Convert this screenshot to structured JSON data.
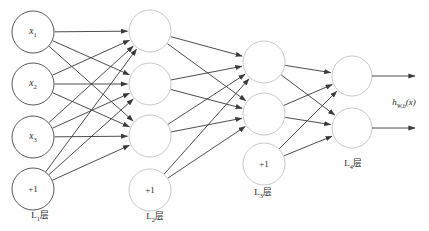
{
  "figure": {
    "type": "neural-network-diagram",
    "background_color": "#fefefe",
    "width": 429,
    "height": 231
  },
  "style": {
    "input_circle_stroke": "#5a5a64",
    "hidden_circle_stroke": "#c9c9c9",
    "edge_color": "#3a3a3a",
    "circle_fill": "#ffffff"
  },
  "layers": [
    {
      "id": "L1",
      "label_main": "L",
      "label_sub": "1",
      "label_suffix": "层",
      "label_x": 40,
      "label_y": 215,
      "cx": 33,
      "r": 21,
      "stroke": "#5a5a64",
      "nodes": [
        {
          "name": "x1",
          "text_main": "x",
          "text_sub": "1",
          "italic": true,
          "cy": 32
        },
        {
          "name": "x2",
          "text_main": "x",
          "text_sub": "2",
          "italic": true,
          "cy": 84
        },
        {
          "name": "x3",
          "text_main": "x",
          "text_sub": "3",
          "italic": true,
          "cy": 137
        },
        {
          "name": "bias-1",
          "text_main": "+1",
          "text_sub": "",
          "italic": false,
          "cy": 189
        }
      ]
    },
    {
      "id": "L2",
      "label_main": "L",
      "label_sub": "2",
      "label_suffix": "层",
      "label_x": 155,
      "label_y": 216,
      "cx": 150,
      "r": 21,
      "stroke": "#c9c9c9",
      "nodes": [
        {
          "name": "a21",
          "text_main": "",
          "text_sub": "",
          "italic": false,
          "cy": 31
        },
        {
          "name": "a22",
          "text_main": "",
          "text_sub": "",
          "italic": false,
          "cy": 84
        },
        {
          "name": "a23",
          "text_main": "",
          "text_sub": "",
          "italic": false,
          "cy": 136
        },
        {
          "name": "bias-2",
          "text_main": "+1",
          "text_sub": "",
          "italic": false,
          "cy": 190
        }
      ]
    },
    {
      "id": "L3",
      "label_main": "L",
      "label_sub": "3",
      "label_suffix": "层",
      "label_x": 263,
      "label_y": 192,
      "cx": 264,
      "r": 21,
      "stroke": "#c9c9c9",
      "nodes": [
        {
          "name": "a31",
          "text_main": "",
          "text_sub": "",
          "italic": false,
          "cy": 62
        },
        {
          "name": "a32",
          "text_main": "",
          "text_sub": "",
          "italic": false,
          "cy": 114
        },
        {
          "name": "bias-3",
          "text_main": "+1",
          "text_sub": "",
          "italic": false,
          "cy": 164
        }
      ]
    },
    {
      "id": "L4",
      "label_main": "L",
      "label_sub": "4",
      "label_suffix": "层",
      "label_x": 353,
      "label_y": 163,
      "cx": 352,
      "r": 20,
      "stroke": "#c9c9c9",
      "nodes": [
        {
          "name": "out1",
          "text_main": "",
          "text_sub": "",
          "italic": false,
          "cy": 76
        },
        {
          "name": "out2",
          "text_main": "",
          "text_sub": "",
          "italic": false,
          "cy": 128
        }
      ]
    }
  ],
  "output": {
    "label_main": "h",
    "label_sub": "W,b",
    "label_arg": "(x)",
    "label_x": 404,
    "label_y": 103,
    "arrows": [
      {
        "name": "output-arrow-top",
        "x1": 372,
        "y1": 76,
        "x2": 415,
        "y2": 76
      },
      {
        "name": "output-arrow-bottom",
        "x1": 372,
        "y1": 128,
        "x2": 415,
        "y2": 128
      }
    ]
  },
  "edges": {
    "L1_to_L2": [
      [
        0,
        0
      ],
      [
        0,
        1
      ],
      [
        0,
        2
      ],
      [
        1,
        0
      ],
      [
        1,
        1
      ],
      [
        1,
        2
      ],
      [
        2,
        0
      ],
      [
        2,
        1
      ],
      [
        2,
        2
      ],
      [
        3,
        0
      ],
      [
        3,
        1
      ],
      [
        3,
        2
      ]
    ],
    "L2_to_L3": [
      [
        0,
        0
      ],
      [
        0,
        1
      ],
      [
        1,
        0
      ],
      [
        1,
        1
      ],
      [
        2,
        0
      ],
      [
        2,
        1
      ],
      [
        3,
        0
      ],
      [
        3,
        1
      ]
    ],
    "L3_to_L4": [
      [
        0,
        0
      ],
      [
        0,
        1
      ],
      [
        1,
        0
      ],
      [
        1,
        1
      ],
      [
        2,
        0
      ],
      [
        2,
        1
      ]
    ]
  }
}
